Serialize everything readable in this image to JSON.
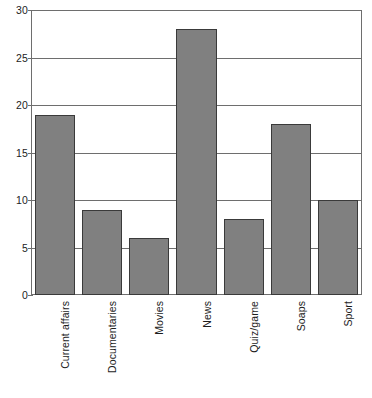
{
  "chart_data": {
    "type": "bar",
    "title": "",
    "subtitle": "",
    "xlabel": "",
    "ylabel": "",
    "categories": [
      "Current affairs",
      "Documentaries",
      "Movies",
      "News",
      "Quiz/game",
      "Soaps",
      "Sport"
    ],
    "values": [
      19,
      9,
      6,
      28,
      8,
      18,
      10
    ],
    "ylim": [
      0,
      30
    ],
    "yticks": [
      0,
      5,
      10,
      15,
      20,
      25,
      30
    ],
    "ytick_labels": [
      "0",
      "5",
      "10",
      "15",
      "20",
      "25",
      "30"
    ],
    "grid": true,
    "grid_axis": "y",
    "legend": false,
    "legend_position": "none",
    "annotations": [],
    "colors": {
      "bar_fill": "#808080",
      "bar_edge": "#3a3a3a",
      "axis": "#6e6e6e",
      "grid": "#6e6e6e",
      "text": "#1d1d1d",
      "background": "#ffffff"
    }
  }
}
